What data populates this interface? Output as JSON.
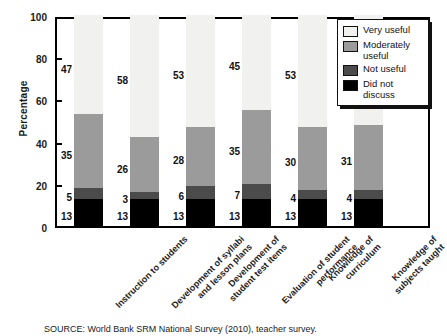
{
  "chart_data": {
    "type": "bar",
    "stacked": true,
    "stack_mode": "percent",
    "title": "",
    "xlabel": "",
    "ylabel": "Percentage",
    "ylim": [
      0,
      100
    ],
    "yticks": [
      0,
      20,
      40,
      60,
      80,
      100
    ],
    "grid": false,
    "legend_position": "top-right",
    "categories": [
      "Instruction to students",
      "Development of syllabi and lesson plans",
      "Development of student test items",
      "Evaluation of student performance",
      "Knowledge of curriculum",
      "Knowledge of subjects taught"
    ],
    "category_lines": [
      [
        "Instruction to students"
      ],
      [
        "Development of syllabi",
        "and lesson plans"
      ],
      [
        "Development of",
        "student test items"
      ],
      [
        "Evaluation of student",
        "performance"
      ],
      [
        "Knowledge of",
        "curriculum"
      ],
      [
        "Knowledge of",
        "subjects taught"
      ]
    ],
    "series": [
      {
        "name": "Did not discuss",
        "color": "#000000",
        "values": [
          13,
          13,
          13,
          13,
          13,
          13
        ]
      },
      {
        "name": "Not useful",
        "color": "#4b4b4b",
        "values": [
          5,
          3,
          6,
          7,
          4,
          4
        ]
      },
      {
        "name": "Moderately useful",
        "color": "#9b9b9b",
        "values": [
          35,
          26,
          28,
          35,
          30,
          31
        ]
      },
      {
        "name": "Very useful",
        "color": "#f1f1ef",
        "values": [
          47,
          58,
          53,
          45,
          53,
          52
        ]
      }
    ],
    "source_note": "SOURCE: World Bank SRM National Survey (2010), teacher survey."
  },
  "legend": {
    "items": [
      {
        "label": "Very useful"
      },
      {
        "label": "Moderately useful"
      },
      {
        "label": "Not useful"
      },
      {
        "label": "Did not discuss"
      }
    ]
  }
}
